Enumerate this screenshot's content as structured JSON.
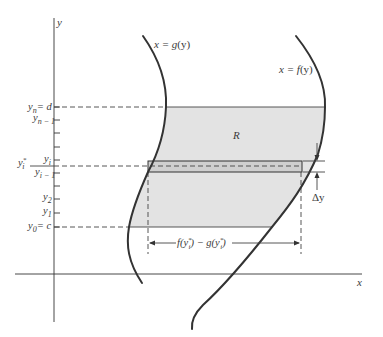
{
  "figure": {
    "colors": {
      "region_fill": "#e3e3e3",
      "strip_fill": "#cfcfcf",
      "curve_stroke": "#333333",
      "axis_stroke": "#333333",
      "text": "#3a3a3a"
    },
    "axes": {
      "x_label": "x",
      "y_label": "y"
    },
    "curves": {
      "left": {
        "label_lhs": "x = g",
        "label_arg": "(y)",
        "name": "x = g(y)"
      },
      "right": {
        "label_lhs": "x = f",
        "label_arg": "(y)",
        "name": "x = f(y)"
      }
    },
    "region_label": "R",
    "y_ticks": {
      "yn": {
        "sym": "y",
        "sub": "n",
        "rhs": "= d"
      },
      "yn1": {
        "sym": "y",
        "sub": "n − 1"
      },
      "yi": {
        "sym": "y",
        "sub": "i"
      },
      "ystar": {
        "sym": "y",
        "sup": "*",
        "sub": "i"
      },
      "yi1": {
        "sym": "y",
        "sub": "i − 1"
      },
      "y2": {
        "sym": "y",
        "sub": "2"
      },
      "y1": {
        "sym": "y",
        "sub": "1"
      },
      "y0": {
        "sym": "y",
        "sub": "0",
        "rhs": "= c"
      }
    },
    "annotations": {
      "width_label_f": "f(y",
      "width_label_mid": ") − g(y",
      "width_label_end": ")",
      "star": "*",
      "i": "i",
      "delta_y": "Δy"
    }
  }
}
